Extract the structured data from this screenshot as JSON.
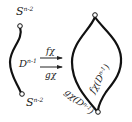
{
  "diagram": {
    "left": {
      "top_label": "S",
      "top_sup": "n-2",
      "disk_label": "D",
      "disk_sup": "n-1",
      "bottom_label": "S",
      "bottom_sup": "n-2"
    },
    "arrows": {
      "upper_label": "fχ",
      "lower_label": "gχ"
    },
    "right": {
      "f_image_label": "fχ(D",
      "f_image_sup": "n-1",
      "f_image_close": ")",
      "g_image_label": "gχ(D",
      "g_image_sup": "n-1",
      "g_image_close": ")"
    },
    "colors": {
      "stroke": "#111111",
      "text": "#222222",
      "background": "#ffffff"
    }
  }
}
